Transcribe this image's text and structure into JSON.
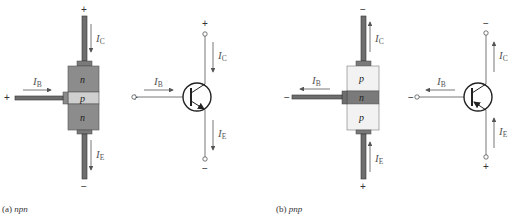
{
  "figure": {
    "panels": [
      {
        "id": "a",
        "caption_prefix": "(a)",
        "caption_type": "npn",
        "physical": {
          "layers": [
            "n",
            "p",
            "n"
          ],
          "layer_colors": [
            "#8c8c8c",
            "#cfcfcf",
            "#8c8c8c"
          ],
          "collector_sign": "+",
          "base_sign": "+",
          "emitter_sign": "−"
        },
        "symbol": {
          "collector_sign": "+",
          "base_sign": "+",
          "emitter_sign": "−",
          "emitter_arrow": "outward"
        },
        "currents": {
          "ib": {
            "main": "I",
            "sub": "B",
            "direction": "into base"
          },
          "ic": {
            "main": "I",
            "sub": "C",
            "direction": "into collector (down)"
          },
          "ie": {
            "main": "I",
            "sub": "E",
            "direction": "out of emitter (down)"
          }
        }
      },
      {
        "id": "b",
        "caption_prefix": "(b)",
        "caption_type": "pnp",
        "physical": {
          "layers": [
            "p",
            "n",
            "p"
          ],
          "layer_colors": [
            "#f2f2f2",
            "#7a7a7a",
            "#f2f2f2"
          ],
          "collector_sign": "−",
          "base_sign": "−",
          "emitter_sign": "+"
        },
        "symbol": {
          "collector_sign": "−",
          "base_sign": "−",
          "emitter_sign": "+",
          "emitter_arrow": "inward"
        },
        "currents": {
          "ib": {
            "main": "I",
            "sub": "B",
            "direction": "out of base"
          },
          "ic": {
            "main": "I",
            "sub": "C",
            "direction": "out of collector (up)"
          },
          "ie": {
            "main": "I",
            "sub": "E",
            "direction": "into emitter (up)"
          }
        }
      }
    ]
  }
}
